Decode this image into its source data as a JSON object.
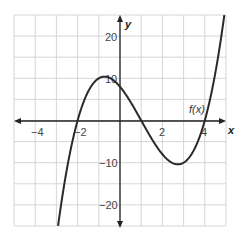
{
  "chart_data": {
    "type": "line",
    "title": "",
    "xlabel": "x",
    "ylabel": "y",
    "xlim": [
      -5,
      5
    ],
    "ylim": [
      -25,
      25
    ],
    "grid": true,
    "x_grid_step": 1,
    "y_grid_step": 5,
    "x_ticks_labeled": [
      -4,
      -2,
      2,
      4
    ],
    "y_ticks_labeled": [
      -20,
      -10,
      10,
      20
    ],
    "series": [
      {
        "name": "f(x)",
        "expression": "x^3 - 3x^2 - 6x + 8",
        "roots": [
          -2,
          1,
          4
        ],
        "local_max": [
          -0.73,
          10.4
        ],
        "local_min": [
          2.73,
          -10.4
        ],
        "x": [
          -2.9,
          -2.5,
          -2,
          -1.5,
          -1,
          -0.5,
          0,
          0.5,
          1,
          1.5,
          2,
          2.5,
          3,
          3.5,
          4,
          4.5,
          4.9
        ],
        "values": [
          -24.2,
          -11.4,
          0,
          6.9,
          10,
          10.1,
          8,
          4.4,
          0,
          -4.4,
          -8,
          -10.1,
          -10,
          -6.9,
          0,
          11.4,
          23.2
        ]
      }
    ],
    "annotations": [
      {
        "text": "f(x)",
        "x": 3.6,
        "y": 6
      }
    ]
  },
  "labels": {
    "x_axis": "x",
    "y_axis": "y",
    "curve": "f(x)",
    "x_ticks": [
      "−4",
      "−2",
      "2",
      "4"
    ],
    "y_ticks": [
      "20",
      "10",
      "−10",
      "−20"
    ]
  },
  "colors": {
    "grid": "#d6d6d6",
    "axis": "#222222",
    "curve": "#2a2a2a"
  }
}
